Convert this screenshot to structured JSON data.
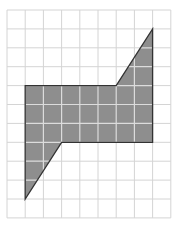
{
  "grid": {
    "columns": 9,
    "rows": 11,
    "origin_x": 7,
    "origin_y": 10,
    "cell_width": 18.2,
    "cell_height": 18.9,
    "line_color": "#d4d4d4"
  },
  "shape": {
    "vertices_grid": [
      [
        1,
        4
      ],
      [
        6,
        4
      ],
      [
        8,
        1
      ],
      [
        8,
        7
      ],
      [
        3,
        7
      ],
      [
        1,
        10
      ]
    ],
    "fill": "#8e8e8e",
    "stroke": "#333333",
    "inner_grid_color": "#dcdcdc"
  }
}
